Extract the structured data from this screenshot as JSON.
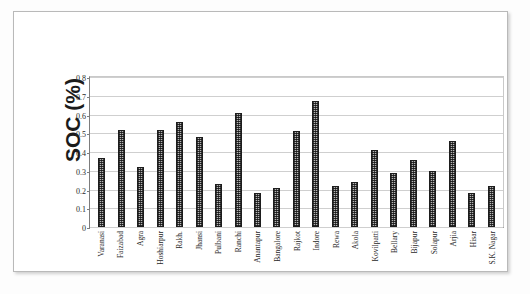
{
  "chart_data": {
    "type": "bar",
    "title": "",
    "subtitle": "",
    "xlabel": "",
    "ylabel": "SOC (%)",
    "ylim": [
      0,
      0.8
    ],
    "yticks": [
      "0",
      "0.1",
      "0.2",
      "0.3",
      "0.4",
      "0.5",
      "0.6",
      "0.7",
      "0.8"
    ],
    "ytick_values": [
      0,
      0.1,
      0.2,
      0.3,
      0.4,
      0.5,
      0.6,
      0.7,
      0.8
    ],
    "grid": true,
    "legend": "none",
    "categories": [
      "Varanasi",
      "Faizabad",
      "Agra",
      "Hoshiarpur",
      "Rakh.",
      "Jhansi",
      "Pulbani",
      "Ranchi",
      "Anantapur",
      "Bangalore",
      "Rajkot",
      "Indore",
      "Rewa",
      "Akola",
      "Kovilpatti",
      "Bellary",
      "Bijapur",
      "Solapur",
      "Arjia",
      "Hisar",
      "S.K. Nagar"
    ],
    "values": [
      0.37,
      0.52,
      0.32,
      0.52,
      0.56,
      0.48,
      0.23,
      0.61,
      0.18,
      0.21,
      0.51,
      0.67,
      0.22,
      0.24,
      0.41,
      0.29,
      0.36,
      0.3,
      0.46,
      0.18,
      0.22
    ]
  },
  "figure": {
    "border_color": "#b9b9b9",
    "background": "#ffffff",
    "bar_outline_color": "#1d1d1d",
    "bar_fill_color": "#b5b5b5",
    "grid_color": "#cfcfcf",
    "axis_color": "#7d7d7d"
  }
}
